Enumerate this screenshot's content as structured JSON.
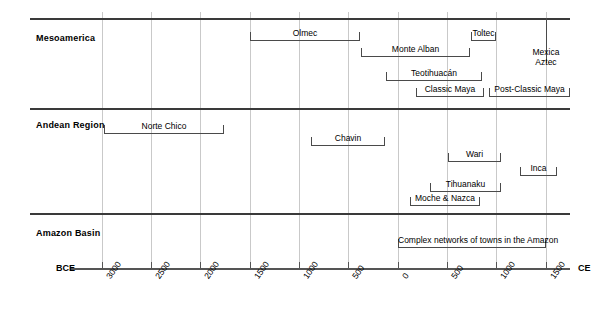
{
  "chart_data": {
    "type": "timeline",
    "title": "",
    "xlabel": "",
    "ylabel": "",
    "axis": {
      "left_label": "BCE",
      "right_label": "CE",
      "ticks": [
        {
          "label": "3000",
          "value": -3000,
          "x": 102
        },
        {
          "label": "2500",
          "value": -2500,
          "x": 151
        },
        {
          "label": "2000",
          "value": -2000,
          "x": 200
        },
        {
          "label": "1500",
          "value": -1500,
          "x": 250
        },
        {
          "label": "1000",
          "value": -1000,
          "x": 299
        },
        {
          "label": "500",
          "value": -500,
          "x": 348
        },
        {
          "label": "0",
          "value": 0,
          "x": 398
        },
        {
          "label": "500",
          "value": 500,
          "x": 447
        },
        {
          "label": "1000",
          "value": 1000,
          "x": 496
        },
        {
          "label": "1500",
          "value": 1500,
          "x": 546
        }
      ],
      "grid": true
    },
    "rows": [
      {
        "name": "Mesoamerica",
        "label": "Mesoamerica",
        "spans": [
          {
            "label": "Olmec",
            "x1": 250,
            "x2": 360,
            "y": 40,
            "start": -1500,
            "end": -400
          },
          {
            "label": "Monte Alban",
            "x1": 361,
            "x2": 470,
            "y": 56,
            "start": -400,
            "end": 700
          },
          {
            "label": "Toltec",
            "x1": 471,
            "x2": 496,
            "y": 40,
            "start": 750,
            "end": 1000
          },
          {
            "label": "Teotihuacán",
            "x1": 386,
            "x2": 482,
            "y": 80,
            "start": -120,
            "end": 850
          },
          {
            "label": "Classic Maya",
            "x1": 416,
            "x2": 484,
            "y": 96,
            "start": 180,
            "end": 870
          },
          {
            "label": "Post-Classic Maya",
            "x1": 489,
            "x2": 570,
            "y": 96,
            "start": 920,
            "end": 1700
          }
        ],
        "free_labels": [
          {
            "label": "Mexica\nAztec",
            "x": 546,
            "y": 47
          }
        ],
        "markers": [
          {
            "name": "mexica-aztec-marker",
            "x": 546,
            "y": 18,
            "height": 45
          }
        ]
      },
      {
        "name": "Andean Region",
        "label": "Andean Region",
        "spans": [
          {
            "label": "Norte Chico",
            "x1": 104,
            "x2": 224,
            "y": 133,
            "start": -2980,
            "end": -1780
          },
          {
            "label": "Chavin",
            "x1": 311,
            "x2": 385,
            "y": 145,
            "start": -880,
            "end": -130
          },
          {
            "label": "Wari",
            "x1": 448,
            "x2": 501,
            "y": 161,
            "start": 510,
            "end": 1050
          },
          {
            "label": "Inca",
            "x1": 520,
            "x2": 557,
            "y": 175,
            "start": 1240,
            "end": 1610
          },
          {
            "label": "Tihuanaku",
            "x1": 430,
            "x2": 501,
            "y": 191,
            "start": 330,
            "end": 1050
          },
          {
            "label": "Moche & Nazca",
            "x1": 410,
            "x2": 480,
            "y": 205,
            "start": 120,
            "end": 830
          }
        ],
        "free_labels": [],
        "markers": []
      },
      {
        "name": "Amazon Basin",
        "label": "Amazon Basin",
        "spans": [
          {
            "label": "Complex networks of towns in the Amazon",
            "x1": 398,
            "x2": 546,
            "y": 247,
            "start": 0,
            "end": 1500
          }
        ],
        "free_labels": [],
        "markers": []
      }
    ],
    "row_rules": [
      {
        "name": "mesoamerica-rule",
        "y": 18,
        "x1": 30,
        "x2": 570
      },
      {
        "name": "andean-rule",
        "y": 108,
        "x1": 30,
        "x2": 570
      },
      {
        "name": "amazon-rule",
        "y": 213,
        "x1": 30,
        "x2": 570
      }
    ],
    "row_label_positions": [
      {
        "y": 33,
        "x": 36
      },
      {
        "y": 120,
        "x": 36
      },
      {
        "y": 228,
        "x": 36
      }
    ],
    "axis_geometry": {
      "y": 268,
      "x1": 70,
      "x2": 570
    }
  }
}
